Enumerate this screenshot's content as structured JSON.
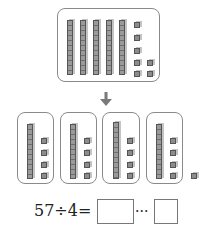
{
  "diagram": {
    "top_group": {
      "rods": 5,
      "cubes": 7
    },
    "arrow": "down-arrow",
    "groups": [
      {
        "rods": 1,
        "cubes": 4
      },
      {
        "rods": 1,
        "cubes": 4
      },
      {
        "rods": 1,
        "cubes": 4
      },
      {
        "rods": 1,
        "cubes": 4
      }
    ],
    "leftover_cubes": 1,
    "separator": ","
  },
  "equation": {
    "expression": "57÷4=",
    "dividend": "57",
    "operator": "÷",
    "divisor": "4",
    "equals": "=",
    "quotient_answer": "",
    "remainder_symbol": "···",
    "remainder_answer": ""
  },
  "colors": {
    "block_fill": "#8c8c8c",
    "block_edge": "#555555",
    "box_border": "#8a8a8a",
    "arrow": "#7a7a7a"
  }
}
